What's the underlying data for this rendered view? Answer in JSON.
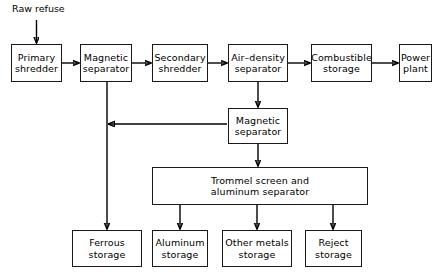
{
  "diagram": {
    "title_label": "Raw refuse",
    "type": "process-flowchart",
    "nodes": [
      {
        "id": "raw-refuse",
        "label": "Raw refuse",
        "x": 12,
        "y": 3,
        "w": 64,
        "h": 14,
        "boxed": false
      },
      {
        "id": "primary-shredder",
        "label": "Primary\nshredder",
        "x": 11,
        "y": 44,
        "w": 51,
        "h": 38,
        "boxed": true
      },
      {
        "id": "magnetic-separator-1",
        "label": "Magnetic\nseparator",
        "x": 80,
        "y": 44,
        "w": 52,
        "h": 38,
        "boxed": true
      },
      {
        "id": "secondary-shredder",
        "label": "Secondary\nshredder",
        "x": 152,
        "y": 44,
        "w": 56,
        "h": 38,
        "boxed": true
      },
      {
        "id": "air-density-separator",
        "label": "Air–density\nseparator",
        "x": 228,
        "y": 44,
        "w": 60,
        "h": 38,
        "boxed": true
      },
      {
        "id": "combustible-storage",
        "label": "Combustible\nstorage",
        "x": 311,
        "y": 44,
        "w": 61,
        "h": 38,
        "boxed": true
      },
      {
        "id": "power-plant",
        "label": "Power\nplant",
        "x": 399,
        "y": 44,
        "w": 33,
        "h": 38,
        "boxed": true
      },
      {
        "id": "magnetic-separator-2",
        "label": "Magnetic\nseparator",
        "x": 228,
        "y": 108,
        "w": 60,
        "h": 36,
        "boxed": true
      },
      {
        "id": "trommel-screen",
        "label": "Trommel screen and\naluminum separator",
        "x": 152,
        "y": 167,
        "w": 216,
        "h": 38,
        "boxed": true
      },
      {
        "id": "ferrous-storage",
        "label": "Ferrous\nstorage",
        "x": 72,
        "y": 230,
        "w": 70,
        "h": 37,
        "boxed": true
      },
      {
        "id": "aluminum-storage",
        "label": "Aluminum\nstorage",
        "x": 152,
        "y": 230,
        "w": 56,
        "h": 37,
        "boxed": true
      },
      {
        "id": "other-metals-storage",
        "label": "Other metals\nstorage",
        "x": 222,
        "y": 230,
        "w": 70,
        "h": 37,
        "boxed": true
      },
      {
        "id": "reject-storage",
        "label": "Reject\nstorage",
        "x": 305,
        "y": 230,
        "w": 57,
        "h": 37,
        "boxed": true
      }
    ],
    "edges": [
      {
        "id": "edge-raw-to-primary",
        "from": "raw-refuse",
        "to": "primary-shredder"
      },
      {
        "id": "edge-primary-to-mag1",
        "from": "primary-shredder",
        "to": "magnetic-separator-1"
      },
      {
        "id": "edge-mag1-to-secondary",
        "from": "magnetic-separator-1",
        "to": "secondary-shredder"
      },
      {
        "id": "edge-secondary-to-airdens",
        "from": "secondary-shredder",
        "to": "air-density-separator"
      },
      {
        "id": "edge-airdens-to-combustible",
        "from": "air-density-separator",
        "to": "combustible-storage"
      },
      {
        "id": "edge-combustible-to-power",
        "from": "combustible-storage",
        "to": "power-plant"
      },
      {
        "id": "edge-airdens-to-mag2",
        "from": "air-density-separator",
        "to": "magnetic-separator-2"
      },
      {
        "id": "edge-mag2-to-ferrous-line",
        "from": "magnetic-separator-2",
        "to": "ferrous-storage"
      },
      {
        "id": "edge-mag1-to-ferrous",
        "from": "magnetic-separator-1",
        "to": "ferrous-storage"
      },
      {
        "id": "edge-mag2-to-trommel",
        "from": "magnetic-separator-2",
        "to": "trommel-screen"
      },
      {
        "id": "edge-trommel-to-aluminum",
        "from": "trommel-screen",
        "to": "aluminum-storage"
      },
      {
        "id": "edge-trommel-to-othermetals",
        "from": "trommel-screen",
        "to": "other-metals-storage"
      },
      {
        "id": "edge-trommel-to-reject",
        "from": "trommel-screen",
        "to": "reject-storage"
      }
    ],
    "colors": {
      "stroke": "#000000",
      "background": "#ffffff",
      "text": "#000000"
    }
  }
}
